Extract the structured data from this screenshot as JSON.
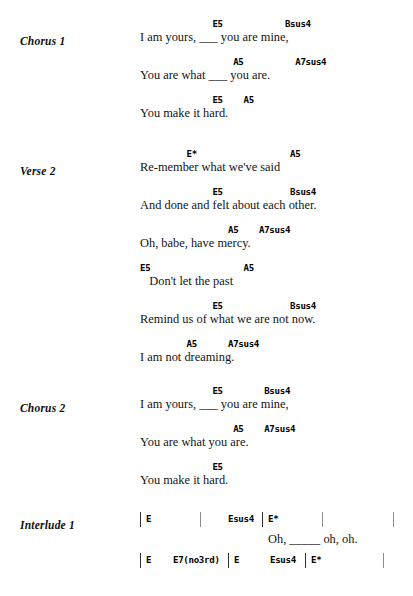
{
  "document": {
    "type": "chord-chart",
    "page_background": "#ffffff",
    "text_color": "#141414",
    "chord_color": "#000000",
    "barline_color": "#2e2e2e"
  },
  "sections": [
    {
      "label": "Chorus 1",
      "label_top": 35,
      "block_top": 18,
      "lines": [
        {
          "chords": "              E5            Bsus4",
          "lyrics": "I am yours, ___ you are mine,"
        },
        {
          "chords": "                  A5          A7sus4",
          "lyrics": "You are what ___ you are."
        },
        {
          "chords": "              E5    A5",
          "lyrics": "You make it hard."
        }
      ]
    },
    {
      "label": "Verse 2",
      "label_top": 165,
      "block_top": 148,
      "lines": [
        {
          "chords": "         E*                  A5",
          "lyrics": "Re-member what we've said"
        },
        {
          "chords": "              E5             Bsus4",
          "lyrics": "And done and felt about each other."
        },
        {
          "chords": "                 A5    A7sus4",
          "lyrics": "Oh, babe, have mercy."
        },
        {
          "chords": "E5                  A5",
          "lyrics": "   Don't let the past"
        },
        {
          "chords": "              E5             Bsus4",
          "lyrics": "Remind us of what we are not now."
        },
        {
          "chords": "         A5      A7sus4",
          "lyrics": "I am not dreaming."
        }
      ]
    },
    {
      "label": "Chorus 2",
      "label_top": 402,
      "block_top": 385,
      "lines": [
        {
          "chords": "              E5        Bsus4",
          "lyrics": "I am yours, ___ you are mine,"
        },
        {
          "chords": "                  A5    A7sus4",
          "lyrics": "You are what you are."
        },
        {
          "chords": "              E5",
          "lyrics": "You make it hard."
        }
      ]
    }
  ],
  "interlude": {
    "label": "Interlude 1",
    "label_top": 519,
    "rows": [
      {
        "top": 512,
        "cells": [
          {
            "text": "E",
            "left": 6
          },
          {
            "text": "Esus4",
            "left": 88
          },
          {
            "text": "E*",
            "left": 128
          }
        ],
        "bars": [
          {
            "left": 0,
            "faint": false
          },
          {
            "left": 60,
            "faint": true
          },
          {
            "left": 122,
            "faint": false
          },
          {
            "left": 182,
            "faint": true
          },
          {
            "left": 253,
            "faint": true
          }
        ]
      },
      {
        "top": 553,
        "cells": [
          {
            "text": "E",
            "left": 6
          },
          {
            "text": "E7(no3rd)",
            "left": 33
          },
          {
            "text": "E",
            "left": 94
          },
          {
            "text": "Esus4",
            "left": 130
          },
          {
            "text": "E*",
            "left": 171
          }
        ],
        "bars": [
          {
            "left": 0,
            "faint": false
          },
          {
            "left": 88,
            "faint": false
          },
          {
            "left": 165,
            "faint": false
          },
          {
            "left": 243,
            "faint": true
          }
        ]
      }
    ],
    "lyric": {
      "text": "Oh, _____ oh, oh.",
      "top": 532,
      "left": 128
    }
  }
}
